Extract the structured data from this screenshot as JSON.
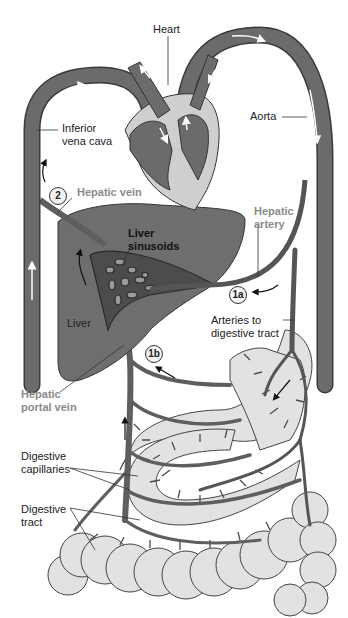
{
  "diagram": {
    "colors": {
      "vessel": "#6b6b6b",
      "vessel_outline": "#3a3a3a",
      "heart_chamber_bg": "#cfcfcf",
      "liver": "#6e6e6e",
      "digestive_tract": "#e2e2e2",
      "label_text": "#222222",
      "gray_label_text": "#8a8a8a",
      "flow_arrow_white": "#ffffff",
      "flow_arrow_black": "#111111"
    },
    "labels": {
      "heart": "Heart",
      "aorta": "Aorta",
      "inferior_vena_cava_line1": "Inferior",
      "inferior_vena_cava_line2": "vena cava",
      "hepatic_vein": "Hepatic vein",
      "hepatic_artery_line1": "Hepatic",
      "hepatic_artery_line2": "artery",
      "liver_sinusoids_line1": "Liver",
      "liver_sinusoids_line2": "sinusoids",
      "liver": "Liver",
      "arteries_line1": "Arteries to",
      "arteries_line2": "digestive tract",
      "hepatic_portal_vein_line1": "Hepatic",
      "hepatic_portal_vein_line2": "portal vein",
      "digestive_capillaries_line1": "Digestive",
      "digestive_capillaries_line2": "capillaries",
      "digestive_tract_line1": "Digestive",
      "digestive_tract_line2": "tract"
    },
    "step_badges": {
      "step_2": "2",
      "step_1a": "1a",
      "step_1b": "1b"
    }
  }
}
